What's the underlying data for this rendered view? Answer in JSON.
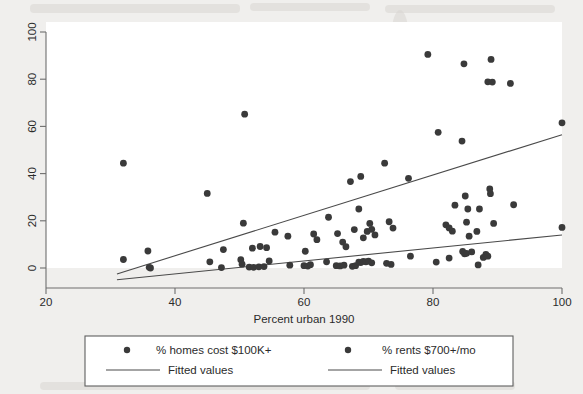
{
  "chart_data": {
    "type": "scatter",
    "title": "",
    "subtitle": "",
    "xlabel": "Percent urban 1990",
    "ylabel": "",
    "xlim": [
      20,
      100
    ],
    "ylim": [
      -8,
      104
    ],
    "xticks": [
      20,
      40,
      60,
      80,
      100
    ],
    "yticks": [
      0,
      20,
      40,
      60,
      80,
      100
    ],
    "xtick_labels": [
      "20",
      "40",
      "60",
      "80",
      "100"
    ],
    "ytick_labels": [
      "0",
      "20",
      "40",
      "60",
      "80",
      "100"
    ],
    "grid": false,
    "legend_position": "bottom",
    "marker_color": "#3a3a3a",
    "line_color": "#4a4a4a",
    "series": [
      {
        "name": "% homes cost $100K+",
        "marker": "filled-circle",
        "points": [
          [
            32.0,
            44.4
          ],
          [
            36.0,
            0.3
          ],
          [
            45.0,
            31.6
          ],
          [
            45.4,
            2.6
          ],
          [
            47.5,
            7.8
          ],
          [
            50.8,
            65.2
          ],
          [
            50.6,
            19.0
          ],
          [
            52.0,
            8.4
          ],
          [
            53.2,
            9.1
          ],
          [
            54.2,
            8.6
          ],
          [
            55.5,
            15.2
          ],
          [
            57.5,
            13.5
          ],
          [
            60.2,
            7.1
          ],
          [
            61.5,
            14.4
          ],
          [
            62.0,
            12.0
          ],
          [
            63.8,
            21.5
          ],
          [
            65.2,
            14.6
          ],
          [
            66.0,
            11.0
          ],
          [
            66.5,
            9.0
          ],
          [
            67.2,
            36.6
          ],
          [
            67.8,
            16.3
          ],
          [
            68.5,
            25.0
          ],
          [
            68.8,
            38.8
          ],
          [
            69.2,
            12.8
          ],
          [
            69.8,
            15.5
          ],
          [
            70.2,
            18.9
          ],
          [
            70.5,
            16.4
          ],
          [
            71.0,
            14.0
          ],
          [
            72.5,
            44.4
          ],
          [
            73.2,
            19.6
          ],
          [
            73.8,
            16.9
          ],
          [
            76.2,
            38.0
          ],
          [
            79.2,
            90.5
          ],
          [
            80.8,
            57.5
          ],
          [
            82.0,
            18.3
          ],
          [
            82.5,
            17.0
          ],
          [
            83.0,
            15.6
          ],
          [
            83.4,
            26.6
          ],
          [
            84.8,
            86.5
          ],
          [
            84.5,
            53.8
          ],
          [
            85.0,
            30.5
          ],
          [
            85.2,
            19.4
          ],
          [
            85.4,
            25.0
          ],
          [
            85.6,
            13.5
          ],
          [
            86.8,
            15.5
          ],
          [
            87.2,
            25.0
          ],
          [
            88.5,
            78.9
          ],
          [
            88.8,
            33.5
          ],
          [
            88.9,
            31.5
          ],
          [
            89.0,
            88.4
          ],
          [
            89.2,
            78.8
          ],
          [
            89.4,
            18.9
          ],
          [
            92.0,
            78.2
          ],
          [
            92.5,
            26.8
          ],
          [
            100.0,
            61.5
          ],
          [
            100.0,
            17.2
          ]
        ],
        "fitted_line": {
          "label": "Fitted values",
          "x": [
            31.0,
            100.0
          ],
          "y": [
            -2.5,
            56.5
          ]
        }
      },
      {
        "name": "% rents $700+/mo",
        "marker": "filled-circle",
        "points": [
          [
            32.0,
            3.6
          ],
          [
            35.8,
            7.2
          ],
          [
            36.2,
            0.0
          ],
          [
            47.2,
            0.2
          ],
          [
            50.2,
            3.5
          ],
          [
            50.4,
            1.6
          ],
          [
            51.5,
            0.4
          ],
          [
            52.2,
            0.3
          ],
          [
            53.0,
            0.5
          ],
          [
            53.8,
            0.6
          ],
          [
            54.6,
            3.0
          ],
          [
            57.8,
            1.2
          ],
          [
            60.0,
            1.0
          ],
          [
            60.6,
            0.8
          ],
          [
            61.0,
            1.4
          ],
          [
            63.5,
            2.6
          ],
          [
            65.0,
            1.0
          ],
          [
            65.6,
            0.9
          ],
          [
            66.2,
            1.2
          ],
          [
            67.5,
            0.7
          ],
          [
            68.0,
            1.0
          ],
          [
            68.5,
            2.5
          ],
          [
            68.8,
            2.3
          ],
          [
            69.2,
            2.8
          ],
          [
            69.6,
            2.6
          ],
          [
            70.0,
            2.9
          ],
          [
            70.5,
            2.2
          ],
          [
            72.8,
            2.0
          ],
          [
            73.5,
            1.5
          ],
          [
            76.5,
            5.0
          ],
          [
            80.5,
            2.5
          ],
          [
            82.5,
            4.2
          ],
          [
            84.6,
            7.0
          ],
          [
            84.9,
            6.0
          ],
          [
            85.2,
            6.2
          ],
          [
            86.0,
            6.8
          ],
          [
            87.0,
            1.3
          ],
          [
            87.8,
            4.5
          ],
          [
            88.2,
            5.8
          ],
          [
            88.5,
            5.0
          ]
        ],
        "fitted_line": {
          "label": "Fitted values",
          "x": [
            31.0,
            100.0
          ],
          "y": [
            -5.0,
            14.0
          ]
        }
      }
    ]
  },
  "axes": {
    "x_axis_name": "x-axis",
    "y_axis_name": "y-axis"
  },
  "legend": {
    "entries": [
      {
        "marker_label": "% homes cost $100K+",
        "line_label": "Fitted values"
      },
      {
        "marker_label": "% rents $700+/mo",
        "line_label": "Fitted values"
      }
    ]
  }
}
